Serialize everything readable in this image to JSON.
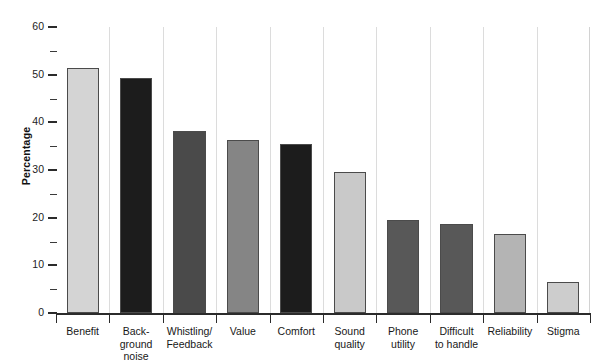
{
  "chart_data": {
    "type": "bar",
    "title": "",
    "subtitle": "",
    "xlabel": "",
    "ylabel": "Percentage",
    "ylim": [
      0,
      60
    ],
    "y_ticks": [
      0,
      10,
      20,
      30,
      40,
      50,
      60
    ],
    "y_minor_ticks": [
      5,
      15,
      25,
      35,
      45,
      55
    ],
    "grid": "vertical category separators only",
    "legend": "none",
    "categories": [
      "Benefit",
      "Back-\nground\nnoise",
      "Whistling/\nFeedback",
      "Value",
      "Comfort",
      "Sound\nquality",
      "Phone\nutility",
      "Difficult\nto handle",
      "Reliability",
      "Stigma"
    ],
    "category_plain": [
      "Benefit",
      "Background noise",
      "Whistling/Feedback",
      "Value",
      "Comfort",
      "Sound quality",
      "Phone utility",
      "Difficult to handle",
      "Reliability",
      "Stigma"
    ],
    "values": [
      51.4,
      49.3,
      38.2,
      36.3,
      35.4,
      29.5,
      19.6,
      18.7,
      16.6,
      6.6
    ],
    "bar_colors": [
      "#d4d4d4",
      "#1c1c1c",
      "#4a4a4a",
      "#858585",
      "#1c1c1c",
      "#c9c9c9",
      "#585858",
      "#585858",
      "#b4b4b4",
      "#cdcdcd"
    ],
    "bar_edge_color": "#4b4b4b",
    "axis_color": "#2b2b2b",
    "gridline_color": "#dcdcdc",
    "background_color": "#ffffff"
  }
}
